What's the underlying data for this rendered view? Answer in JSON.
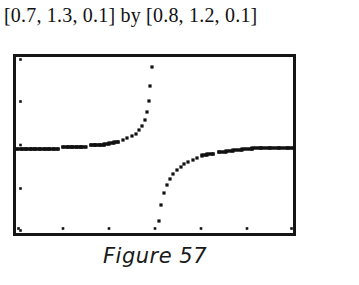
{
  "window_title": "[0.7, 1.3, 0.1] by [0.8, 1.2, 0.1]",
  "caption": "Figure 57",
  "colors": {
    "ink": "#161616",
    "background": "#ffffff",
    "plot_ink": "#111111"
  },
  "chart_data": {
    "type": "scatter",
    "title": "[0.7, 1.3, 0.1] by [0.8, 1.2, 0.1]",
    "subtitle": "Figure 57",
    "xlabel": "",
    "ylabel": "",
    "xlim": [
      0.7,
      1.3
    ],
    "ylim": [
      0.8,
      1.2
    ],
    "xtick_step": 0.1,
    "ytick_step": 0.1,
    "xticks": [
      0.7,
      0.8,
      0.9,
      1.0,
      1.1,
      1.2,
      1.3
    ],
    "yticks": [
      0.8,
      0.9,
      1.0,
      1.1,
      1.2
    ],
    "grid": false,
    "legend": false,
    "axis_style": "calculator-screen-border-with-tick-dots",
    "series": [
      {
        "name": "left-branch",
        "x": [
          0.7,
          0.71,
          0.72,
          0.73,
          0.74,
          0.75,
          0.76,
          0.77,
          0.78,
          0.79,
          0.8,
          0.81,
          0.82,
          0.83,
          0.84,
          0.85,
          0.86,
          0.87,
          0.88,
          0.89,
          0.9,
          0.91,
          0.92,
          0.93,
          0.94,
          0.95,
          0.958,
          0.966,
          0.972,
          0.978,
          0.982,
          0.986,
          0.99,
          0.994
        ],
        "y": [
          0.991,
          0.991,
          0.991,
          0.991,
          0.991,
          0.991,
          0.991,
          0.991,
          0.991,
          0.991,
          0.996,
          0.996,
          0.996,
          0.996,
          0.996,
          0.996,
          0.999,
          0.999,
          0.999,
          1.001,
          1.003,
          1.005,
          1.008,
          1.011,
          1.015,
          1.02,
          1.026,
          1.034,
          1.044,
          1.058,
          1.075,
          1.1,
          1.136,
          1.18
        ]
      },
      {
        "name": "right-branch",
        "x": [
          1.008,
          1.014,
          1.02,
          1.026,
          1.032,
          1.04,
          1.048,
          1.056,
          1.064,
          1.072,
          1.082,
          1.092,
          1.102,
          1.114,
          1.126,
          1.14,
          1.155,
          1.17,
          1.19,
          1.21,
          1.23,
          1.25,
          1.27,
          1.29,
          1.3
        ],
        "y": [
          0.826,
          0.862,
          0.89,
          0.908,
          0.922,
          0.934,
          0.943,
          0.95,
          0.956,
          0.961,
          0.966,
          0.97,
          0.974,
          0.977,
          0.98,
          0.983,
          0.985,
          0.987,
          0.989,
          0.991,
          0.993,
          0.993,
          0.993,
          0.993,
          0.993
        ]
      }
    ]
  }
}
